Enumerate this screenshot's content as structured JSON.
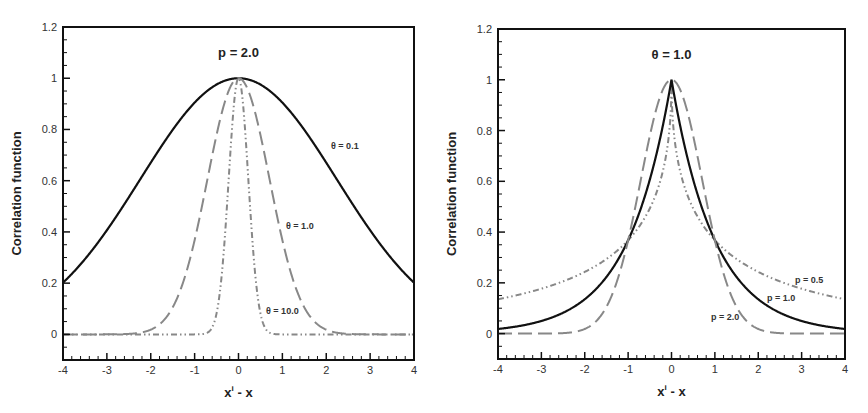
{
  "chart_data": [
    {
      "type": "line",
      "title": "p = 2.0",
      "xlabel": "x^i - x",
      "xlabel_main": "x",
      "xlabel_sup": "i",
      "xlabel_rest": " - x",
      "ylabel": "Correlation function",
      "xlim": [
        -4,
        4
      ],
      "ylim": [
        -0.1,
        1.2
      ],
      "xticks": [
        -4,
        -3,
        -2,
        -1,
        0,
        1,
        2,
        3,
        4
      ],
      "yticks": [
        0,
        0.2,
        0.4,
        0.6,
        0.8,
        1,
        1.2
      ],
      "ytick_labels": [
        "0",
        "0.2",
        "0.4",
        "0.6",
        "0.8",
        "1",
        "1.2"
      ],
      "grid": false,
      "formula": "exp(-theta * |x|^p)",
      "p": 2.0,
      "series": [
        {
          "name": "θ = 0.1",
          "theta": 0.1,
          "style": "solid",
          "color": "#111111",
          "x": [
            -4,
            -3,
            -2,
            -1,
            0,
            1,
            2,
            3,
            4
          ],
          "values": [
            0.2,
            0.41,
            0.67,
            0.9,
            1.0,
            0.9,
            0.67,
            0.41,
            0.2
          ],
          "label_pos": [
            331,
            149
          ]
        },
        {
          "name": "θ = 1.0",
          "theta": 1.0,
          "style": "dashed",
          "color": "#888888",
          "x": [
            -3,
            -2,
            -1,
            -0.5,
            0,
            0.5,
            1,
            2,
            3
          ],
          "values": [
            0.0001,
            0.018,
            0.37,
            0.78,
            1.0,
            0.78,
            0.37,
            0.018,
            0.0001
          ],
          "label_pos": [
            286,
            229
          ]
        },
        {
          "name": "θ = 10.0",
          "theta": 10.0,
          "style": "dash-dot-dot",
          "color": "#888888",
          "x": [
            -1,
            -0.5,
            -0.25,
            0,
            0.25,
            0.5,
            1
          ],
          "values": [
            0.0,
            0.08,
            0.54,
            1.0,
            0.54,
            0.08,
            0.0
          ],
          "label_pos": [
            266,
            314
          ]
        }
      ]
    },
    {
      "type": "line",
      "title": "θ = 1.0",
      "xlabel": "x^i - x",
      "xlabel_main": "x",
      "xlabel_sup": "i",
      "xlabel_rest": " - x",
      "ylabel": "Correlation function",
      "xlim": [
        -4,
        4
      ],
      "ylim": [
        -0.1,
        1.2
      ],
      "xticks": [
        -4,
        -3,
        -2,
        -1,
        0,
        1,
        2,
        3,
        4
      ],
      "yticks": [
        0,
        0.2,
        0.4,
        0.6,
        0.8,
        1,
        1.2
      ],
      "ytick_labels": [
        "0",
        "0.2",
        "0.4",
        "0.6",
        "0.8",
        "1",
        "1.2"
      ],
      "grid": false,
      "formula": "exp(-theta * |x|^p)",
      "theta": 1.0,
      "series": [
        {
          "name": "p = 0.5",
          "p": 0.5,
          "style": "dash-dot-dot",
          "color": "#888888",
          "x": [
            -4,
            -3,
            -2,
            -1,
            0,
            1,
            2,
            3,
            4
          ],
          "values": [
            0.14,
            0.18,
            0.24,
            0.37,
            1.0,
            0.37,
            0.24,
            0.18,
            0.14
          ],
          "label_pos": [
            795,
            283
          ]
        },
        {
          "name": "p = 1.0",
          "p": 1.0,
          "style": "solid",
          "color": "#111111",
          "x": [
            -4,
            -3,
            -2,
            -1,
            0,
            1,
            2,
            3,
            4
          ],
          "values": [
            0.02,
            0.05,
            0.14,
            0.37,
            1.0,
            0.37,
            0.14,
            0.05,
            0.02
          ],
          "label_pos": [
            767,
            301
          ]
        },
        {
          "name": "p = 2.0",
          "p": 2.0,
          "style": "dashed",
          "color": "#888888",
          "x": [
            -4,
            -3,
            -2,
            -1,
            0,
            1,
            2,
            3,
            4
          ],
          "values": [
            0.0,
            0.0001,
            0.018,
            0.37,
            1.0,
            0.37,
            0.018,
            0.0001,
            0.0
          ],
          "label_pos": [
            711,
            320
          ]
        }
      ]
    }
  ]
}
